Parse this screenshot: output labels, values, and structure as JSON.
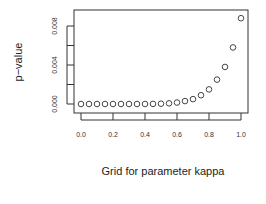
{
  "chart_data": {
    "type": "scatter",
    "title": "",
    "xlabel": "Grid for parameter kappa",
    "ylabel": "p−value",
    "xlim": [
      0.0,
      1.0
    ],
    "ylim": [
      0.0,
      0.0088
    ],
    "x_ticks": [
      "0.0",
      "0.2",
      "0.4",
      "0.6",
      "0.8",
      "1.0"
    ],
    "y_ticks": [
      "0.000",
      "0.004",
      "0.008"
    ],
    "grid": false,
    "legend": null,
    "marker": "open-circle",
    "series": [
      {
        "name": "p-value",
        "x": [
          0.0,
          0.05,
          0.1,
          0.15,
          0.2,
          0.25,
          0.3,
          0.35,
          0.4,
          0.45,
          0.5,
          0.55,
          0.6,
          0.65,
          0.7,
          0.75,
          0.8,
          0.85,
          0.9,
          0.95,
          1.0
        ],
        "values": [
          0.0,
          0.0,
          0.0,
          0.0,
          0.0,
          0.0,
          0.0,
          0.0,
          0.0,
          1e-05,
          3e-05,
          7e-05,
          0.00015,
          0.0003,
          0.0005,
          0.0009,
          0.0015,
          0.0025,
          0.0038,
          0.0058,
          0.0088
        ]
      }
    ]
  }
}
